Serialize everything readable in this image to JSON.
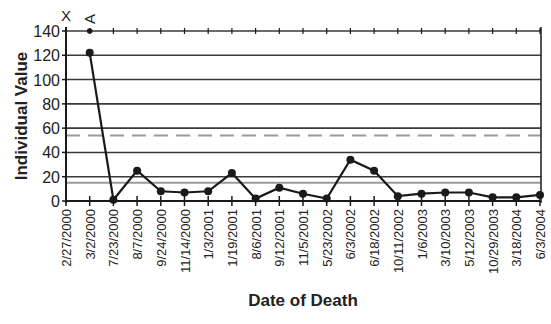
{
  "chart_data": {
    "type": "line",
    "title": "",
    "xlabel": "Date of Death",
    "ylabel": "Individual Value",
    "ylim": [
      0,
      140
    ],
    "yticks": [
      0,
      20,
      40,
      60,
      80,
      100,
      120,
      140
    ],
    "grid": true,
    "legend": null,
    "categories": [
      "2/27/2000",
      "3/2/2000",
      "7/23/2000",
      "8/7/2000",
      "9/24/2000",
      "11/14/2000",
      "1/3/2001",
      "1/19/2001",
      "8/6/2001",
      "9/12/2001",
      "11/5/2001",
      "5/23/2002",
      "6/3/2002",
      "6/18/2002",
      "10/11/2002",
      "1/6/2003",
      "3/10/2003",
      "5/12/2003",
      "10/29/2003",
      "3/18/2004",
      "6/3/2004"
    ],
    "series": [
      {
        "name": "Individual Value",
        "values": [
          null,
          122,
          1,
          25,
          8,
          7,
          8,
          23,
          2,
          11,
          6,
          2,
          34,
          25,
          4,
          6,
          7,
          7,
          3,
          3,
          5
        ]
      }
    ],
    "reference_lines": [
      {
        "name": "Upper Control Limit",
        "value": 54,
        "style": "dashed",
        "color": "#9a9a9a"
      },
      {
        "name": "Center Line",
        "value": 15,
        "style": "solid",
        "color": "#9a9a9a"
      }
    ],
    "annotations": [
      {
        "category": "2/27/2000",
        "text": "X",
        "y": 140
      },
      {
        "category": "3/2/2000",
        "text": "A",
        "y": 140,
        "rotated": true,
        "marker": true
      }
    ]
  },
  "colors": {
    "line": "#1a1a1a",
    "grid": "#3a3a3a",
    "reference": "#9a9a9a",
    "axis": "#1a1a1a"
  }
}
